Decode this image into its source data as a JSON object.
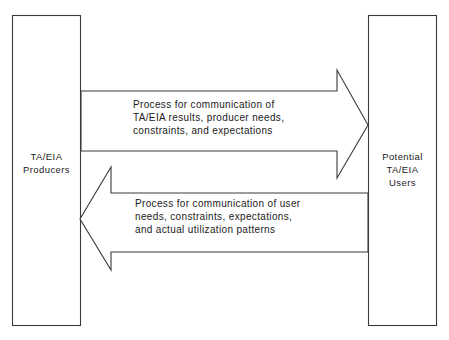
{
  "diagram": {
    "type": "block-flow-diagram",
    "background_color": "#ffffff",
    "line_color": "#3a3a3a",
    "text_color": "#1b1b1b",
    "nodes": [
      {
        "id": "producers",
        "label": "TA/EIA\nProducers",
        "position": "left"
      },
      {
        "id": "users",
        "label": "Potential\nTA/EIA\nUsers",
        "position": "right"
      }
    ],
    "flows": [
      {
        "id": "producers-to-users",
        "direction": "left-to-right",
        "from": "producers",
        "to": "users",
        "label": "Process for communication of\nTA/EIA results, producer needs,\nconstraints, and expectations"
      },
      {
        "id": "users-to-producers",
        "direction": "right-to-left",
        "from": "users",
        "to": "producers",
        "label": "Process for communication of user\nneeds, constraints, expectations,\nand actual utilization patterns"
      }
    ]
  }
}
